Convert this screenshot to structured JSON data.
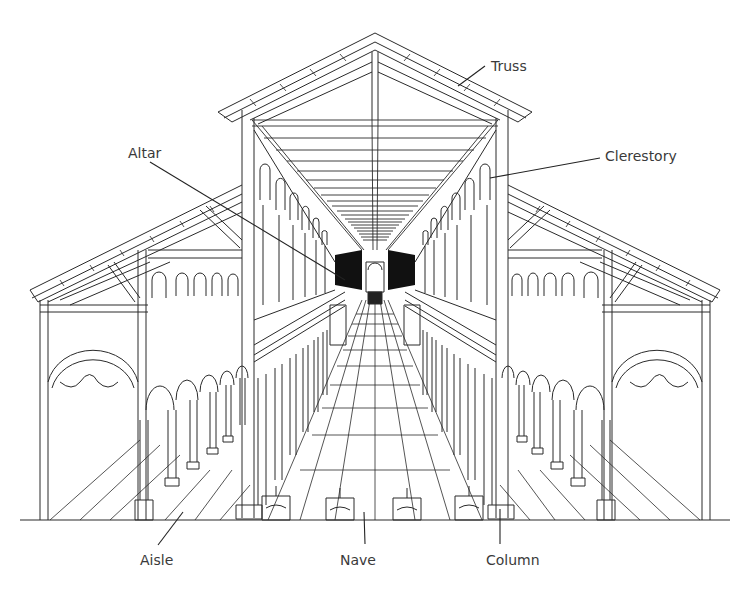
{
  "diagram": {
    "colors": {
      "line": "#2a2a2a",
      "background": "#ffffff",
      "label": "#3a3a3a",
      "vanishing_dark": "#111111"
    },
    "labels": [
      {
        "id": "truss",
        "text": "Truss",
        "x": 491,
        "y": 58,
        "leader": [
          [
            485,
            66
          ],
          [
            458,
            86
          ]
        ]
      },
      {
        "id": "altar",
        "text": "Altar",
        "x": 128,
        "y": 145,
        "leader": [
          [
            150,
            162
          ],
          [
            345,
            280
          ]
        ]
      },
      {
        "id": "clerestory",
        "text": "Clerestory",
        "x": 605,
        "y": 148,
        "leader": [
          [
            600,
            158
          ],
          [
            490,
            178
          ]
        ]
      },
      {
        "id": "aisle",
        "text": "Aisle",
        "x": 140,
        "y": 552,
        "leader": [
          [
            158,
            545
          ],
          [
            183,
            512
          ]
        ]
      },
      {
        "id": "nave",
        "text": "Nave",
        "x": 340,
        "y": 552,
        "leader": [
          [
            365,
            544
          ],
          [
            364,
            512
          ]
        ]
      },
      {
        "id": "column",
        "text": "Column",
        "x": 486,
        "y": 552,
        "leader": [
          [
            500,
            544
          ],
          [
            500,
            509
          ]
        ]
      }
    ]
  }
}
